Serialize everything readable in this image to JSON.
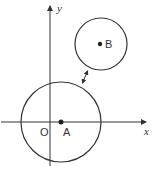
{
  "diagram": {
    "type": "coordinate-geometry",
    "axes": {
      "x_label": "x",
      "y_label": "y",
      "origin_label": "O"
    },
    "circles": [
      {
        "name": "A",
        "center_label": "A",
        "center_px": [
          61,
          122
        ],
        "radius_px": 40
      },
      {
        "name": "B",
        "center_label": "B",
        "center_px": [
          101,
          44
        ],
        "radius_px": 26
      }
    ],
    "distance_marker": {
      "description": "double-headed arrow showing the gap between the two circles"
    },
    "colors": {
      "stroke": "#333333",
      "background": "#ffffff"
    }
  }
}
